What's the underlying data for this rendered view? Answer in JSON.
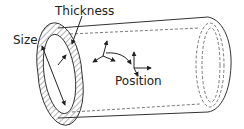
{
  "diagram": {
    "labels": {
      "thickness": "Thickness",
      "size": "Size",
      "position": "Position"
    },
    "colors": {
      "stroke": "#333333",
      "background": "#ffffff"
    }
  }
}
